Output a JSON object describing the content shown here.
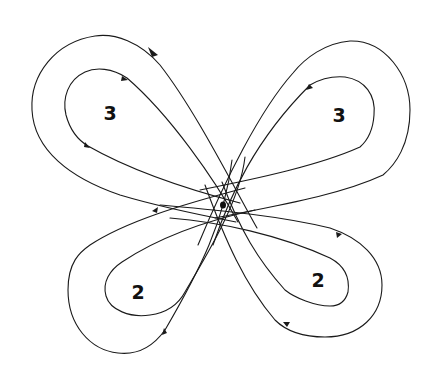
{
  "diagram": {
    "type": "phase-portrait / orbit loops",
    "center_point": {
      "x": 223,
      "y": 205,
      "label": ""
    },
    "loops": [
      {
        "id": "top-left",
        "label": "3",
        "label_pos": {
          "x": 110,
          "y": 113
        }
      },
      {
        "id": "top-right",
        "label": "3",
        "label_pos": {
          "x": 339,
          "y": 115
        }
      },
      {
        "id": "bottom-left",
        "label": "2",
        "label_pos": {
          "x": 138,
          "y": 292
        }
      },
      {
        "id": "bottom-right",
        "label": "2",
        "label_pos": {
          "x": 318,
          "y": 280
        }
      }
    ],
    "colors": {
      "stroke": "#1a1a1a",
      "background": "#ffffff"
    }
  }
}
